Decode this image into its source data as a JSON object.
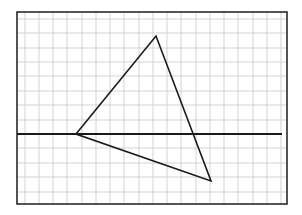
{
  "diagram": {
    "type": "grid-triangle",
    "canvas": {
      "width": 302,
      "height": 215
    },
    "frame": {
      "x1": 17,
      "y1": 12,
      "x2": 287,
      "y2": 204,
      "color": "#2a2a2a",
      "stroke_width": 1.6
    },
    "grid": {
      "color": "#c8c8c8",
      "stroke_width": 0.8,
      "vertical_x": [
        25,
        39,
        53,
        67,
        82,
        96,
        110,
        124,
        139,
        153,
        167,
        181,
        196,
        210,
        224,
        238,
        253,
        267,
        281
      ],
      "horizontal_y": [
        19,
        33,
        48,
        62,
        76,
        91,
        105,
        120,
        148,
        163,
        177,
        192
      ]
    },
    "axis": {
      "x1": 17,
      "y1": 134,
      "x2": 282,
      "y2": 134,
      "color": "#1a1a1a",
      "stroke_width": 1.8
    },
    "triangle": {
      "vertices": [
        {
          "name": "A",
          "x": 76,
          "y": 134
        },
        {
          "name": "B",
          "x": 156,
          "y": 36
        },
        {
          "name": "C",
          "x": 211,
          "y": 181
        }
      ],
      "color": "#1a1a1a",
      "stroke_width": 1.6
    }
  }
}
